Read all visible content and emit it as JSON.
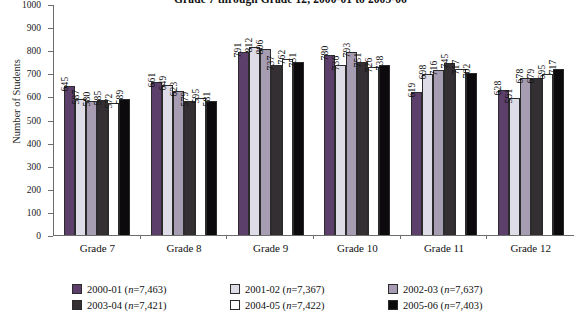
{
  "chart_data": {
    "type": "bar",
    "title": "Grade 7 through Grade 12, 2000-01 to 2005-06",
    "xlabel": "",
    "ylabel": "Number of Students",
    "ylim": [
      0,
      1000
    ],
    "ytick_step": 100,
    "ytick_labels": [
      "1000",
      "900",
      "800",
      "700",
      "600",
      "500",
      "400",
      "300",
      "200",
      "100",
      "0"
    ],
    "grid": false,
    "legend_position": "bottom",
    "categories": [
      "Grade 7",
      "Grade 8",
      "Grade 9",
      "Grade 10",
      "Grade 11",
      "Grade 12"
    ],
    "series": [
      {
        "name": "2000-01",
        "n": "7,463",
        "legend_label": "2000-01 (n=7,463)",
        "color": "#5c3f6b",
        "values": [
          645,
          661,
          791,
          780,
          619,
          628
        ]
      },
      {
        "name": "2001-02",
        "n": "7,367",
        "legend_label": "2001-02 (n=7,367)",
        "color": "#dedce6",
        "values": [
          587,
          649,
          812,
          736,
          698,
          591
        ]
      },
      {
        "name": "2002-03",
        "n": "7,637",
        "legend_label": "2002-03 (n=7,637)",
        "color": "#a79db2",
        "values": [
          580,
          623,
          806,
          793,
          716,
          678
        ]
      },
      {
        "name": "2003-04",
        "n": "7,421",
        "legend_label": "2003-04 (n=7,421)",
        "color": "#332f33",
        "values": [
          585,
          579,
          737,
          751,
          745,
          679
        ]
      },
      {
        "name": "2004-05",
        "n": "7,422",
        "legend_label": "2004-05 (n=7,422)",
        "color": "#ffffff",
        "values": [
          572,
          595,
          762,
          726,
          717,
          695
        ]
      },
      {
        "name": "2005-06",
        "n": "7,403",
        "legend_label": "2005-06 (n=7,403)",
        "color": "#0c0a0c",
        "values": [
          589,
          581,
          751,
          738,
          702,
          717
        ]
      }
    ]
  }
}
